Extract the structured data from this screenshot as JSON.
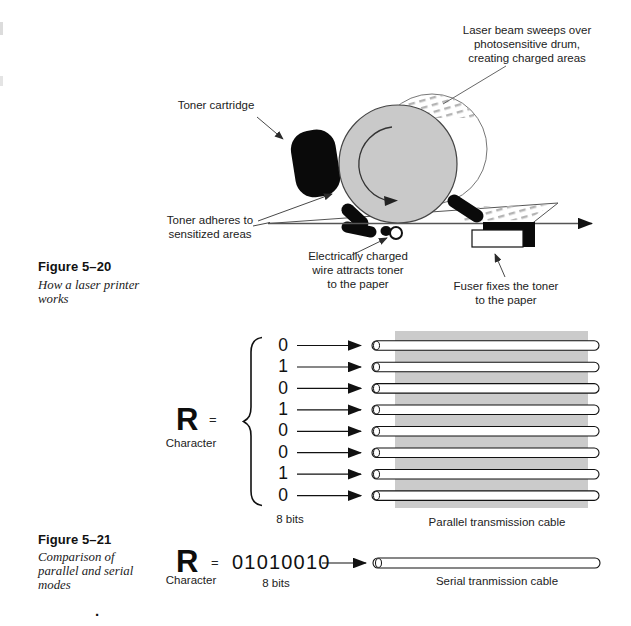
{
  "page": {
    "stray_period": "."
  },
  "figure20": {
    "caption_title": "Figure 5–20",
    "caption_body": "How a laser printer\nworks",
    "labels": {
      "laser_beam": "Laser beam sweeps over\nphotosensitive drum,\ncreating charged areas",
      "toner_cartridge": "Toner cartridge",
      "toner_adheres": "Toner adheres to\nsensitized areas",
      "charged_wire": "Electrically charged\nwire attracts toner\nto the paper",
      "fuser": "Fuser fixes the toner\nto the paper"
    }
  },
  "figure21": {
    "caption_title": "Figure 5–21",
    "caption_body": "Comparison of\nparallel and serial\nmodes",
    "parallel": {
      "character": "R",
      "equals": "=",
      "character_label": "Character",
      "bits": [
        "0",
        "1",
        "0",
        "1",
        "0",
        "0",
        "1",
        "0"
      ],
      "bits_label": "8 bits",
      "cable_label": "Parallel transmission cable"
    },
    "serial": {
      "character": "R",
      "equals": "=",
      "bits_string": "01010010",
      "character_label": "Character",
      "bits_label": "8 bits",
      "cable_label": "Serial tranmission cable"
    }
  },
  "colors": {
    "drum_fill": "#c9c9c9",
    "cable_bg": "#cbcbcb",
    "hatch": "#b4b4b4",
    "ink": "#1c1c1c"
  }
}
